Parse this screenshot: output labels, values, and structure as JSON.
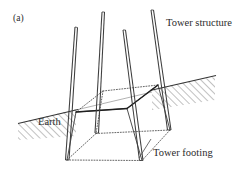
{
  "figure": {
    "panel_label": "(a)",
    "caption_labels": {
      "tower_structure": "Tower structure",
      "earth": "Earth",
      "tower_footing": "Tower footing"
    },
    "colors": {
      "line": "#3a3a3a",
      "line_dark": "#262626",
      "line_light": "#6e6e6e",
      "hatch": "#55555 5",
      "background": "#ffffff",
      "text": "#2b2b2b"
    },
    "diagram_data": {
      "type": "engineering-perspective-drawing",
      "subject": "Transmission tower footing embedded in sloping earth",
      "elements": [
        {
          "name": "tower-leg-1",
          "role": "tower structure member",
          "top": [
            76,
            27
          ],
          "bottom": [
            67,
            160
          ]
        },
        {
          "name": "tower-leg-2",
          "role": "tower structure member",
          "top": [
            103,
            12
          ],
          "bottom": [
            96,
            133
          ]
        },
        {
          "name": "tower-leg-3",
          "role": "tower structure member",
          "top": [
            124,
            30
          ],
          "bottom": [
            142,
            160
          ]
        },
        {
          "name": "tower-leg-4",
          "role": "tower structure member",
          "top": [
            152,
            10
          ],
          "bottom": [
            170,
            130
          ]
        },
        {
          "name": "earth-surface-line",
          "role": "sloping ground surface",
          "points": [
            [
              18,
              123
            ],
            [
              215,
              77
            ]
          ],
          "hatched": true,
          "hatch_side": "below"
        },
        {
          "name": "footing-frustum-top-face",
          "role": "tower footing top",
          "corners": [
            [
              76,
              112
            ],
            [
              127,
              108
            ],
            [
              158,
              85
            ],
            [
              103,
              91
            ]
          ]
        },
        {
          "name": "footing-frustum-bottom-face",
          "role": "tower footing base",
          "corners": [
            [
              67,
              160
            ],
            [
              142,
              160
            ],
            [
              170,
              130
            ],
            [
              96,
              133
            ]
          ]
        }
      ],
      "annotations": [
        {
          "label": "Tower structure",
          "target": "tower-leg-4",
          "position": [
            166,
            18
          ]
        },
        {
          "label": "Earth",
          "target": "earth-surface-line",
          "position": [
            38,
            117
          ]
        },
        {
          "label": "Tower footing",
          "target": "footing-frustum-bottom-face",
          "leader": [
            [
              150,
              137
            ],
            [
              140,
              158
            ]
          ],
          "position": [
            153,
            148
          ]
        }
      ]
    }
  }
}
